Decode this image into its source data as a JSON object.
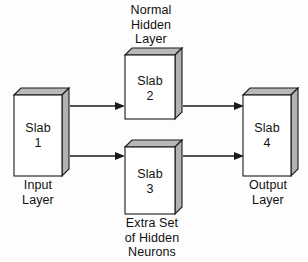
{
  "figure": {
    "type": "block-diagram",
    "background_color": "#fdfdfd",
    "line_color": "#1a1a1a",
    "face_colors": {
      "front": "#ffffff",
      "top": "#b9b9b9",
      "side": "#b2b2b2"
    }
  },
  "nodes": [
    {
      "id": "slab1",
      "title_line1": "Slab",
      "title_line2": "1",
      "caption": "Input\nLayer",
      "caption_position": "below"
    },
    {
      "id": "slab2",
      "title_line1": "Slab",
      "title_line2": "2",
      "caption": "Normal\nHidden\nLayer",
      "caption_position": "above"
    },
    {
      "id": "slab3",
      "title_line1": "Slab",
      "title_line2": "3",
      "caption": "Extra Set\nof Hidden\nNeurons",
      "caption_position": "below"
    },
    {
      "id": "slab4",
      "title_line1": "Slab",
      "title_line2": "4",
      "caption": "Output\nLayer",
      "caption_position": "below"
    }
  ],
  "edges": [
    {
      "id": "edge-1-2",
      "from": "slab1",
      "to": "slab2",
      "style": "solid-arrow"
    },
    {
      "id": "edge-1-3",
      "from": "slab1",
      "to": "slab3",
      "style": "solid-arrow"
    },
    {
      "id": "edge-2-4",
      "from": "slab2",
      "to": "slab4",
      "style": "solid-arrow"
    },
    {
      "id": "edge-3-4",
      "from": "slab3",
      "to": "slab4",
      "style": "solid-arrow"
    }
  ]
}
